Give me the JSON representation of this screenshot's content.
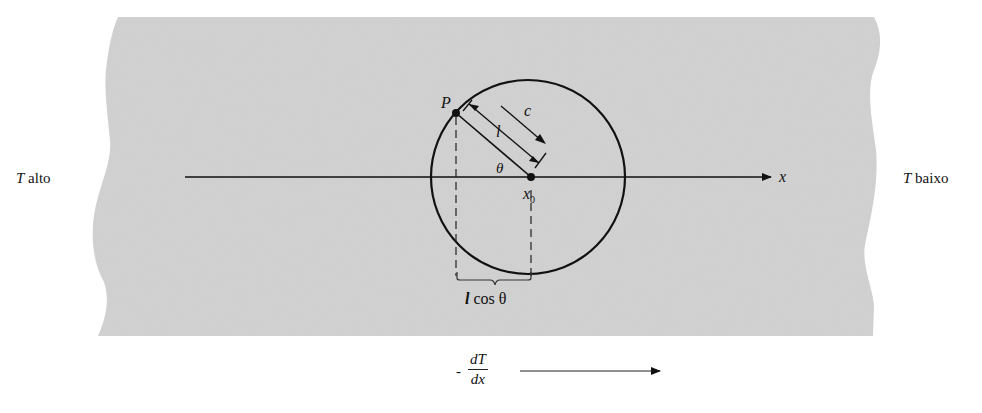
{
  "diagram": {
    "type": "heat-conduction-molecule-free-path",
    "colors": {
      "slab_fill": "#d2d2d2",
      "ink": "#111111",
      "background": "#ffffff"
    },
    "labels": {
      "left_side": {
        "T": "T",
        "text": " alto"
      },
      "right_side": {
        "T": "T",
        "text": " baixo"
      },
      "x_axis": "x",
      "point_P": "P",
      "speed": "c",
      "free_path": "l",
      "angle": "θ",
      "origin": {
        "base": "x",
        "sub": "0"
      },
      "projection": {
        "l": "l",
        "rest": " cos θ"
      },
      "gradient": {
        "minus": "-",
        "numerator": "dT",
        "denominator": "dx"
      }
    }
  }
}
